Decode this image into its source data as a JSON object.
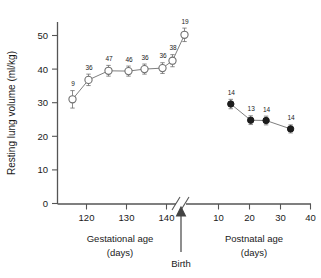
{
  "chart_data": {
    "type": "scatter",
    "title": "",
    "ylabel": "Resting lung volume (ml/kg)",
    "ylim": [
      0,
      54
    ],
    "yticks": [
      0,
      10,
      20,
      30,
      40,
      50
    ],
    "ytick_labels": [
      "0",
      "10",
      "20",
      "30",
      "40",
      "50"
    ],
    "grid": false,
    "legend": false,
    "axis_break": true,
    "annotations": [
      {
        "text": "Birth",
        "kind": "arrow-label"
      }
    ],
    "panels": [
      {
        "name": "gestational",
        "xlabel": "Gestational age",
        "xlabel_units": "(days)",
        "xlim": [
          113,
          147
        ],
        "xticks": [
          120,
          130,
          140
        ],
        "xtick_labels": [
          "120",
          "130",
          "140"
        ],
        "marker": "open-circle",
        "x": [
          116.5,
          120.5,
          125.5,
          130.5,
          134.5,
          139.0,
          141.5,
          144.5
        ],
        "y": [
          31.0,
          36.8,
          39.5,
          39.4,
          40.0,
          40.3,
          42.5,
          50.2
        ],
        "yerr": [
          2.6,
          1.7,
          1.6,
          1.5,
          1.5,
          1.6,
          1.8,
          2.0
        ],
        "n_labels": [
          "9",
          "36",
          "47",
          "46",
          "36",
          "36",
          "38",
          "19"
        ]
      },
      {
        "name": "postnatal",
        "xlabel": "Postnatal age",
        "xlabel_units": "(days)",
        "xlim": [
          0,
          40
        ],
        "xticks": [
          10,
          20,
          30,
          40
        ],
        "xtick_labels": [
          "10",
          "20",
          "30",
          "40"
        ],
        "marker": "filled-circle",
        "x": [
          14.0,
          20.5,
          25.5,
          33.5
        ],
        "y": [
          29.6,
          24.8,
          24.7,
          22.2
        ],
        "yerr": [
          1.4,
          1.3,
          1.3,
          1.2
        ],
        "n_labels": [
          "14",
          "13",
          "14",
          "14"
        ]
      }
    ]
  },
  "colors": {
    "axis": "#555555",
    "open_marker_stroke": "#6f6f6f",
    "filled_marker": "#1c1c1c",
    "text": "#1a1a1a",
    "background": "#ffffff"
  }
}
